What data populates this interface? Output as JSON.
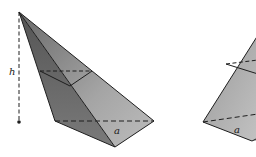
{
  "diagram": {
    "left_pyramid": {
      "height_label": "h",
      "base_edge_label": "a",
      "apex": [
        19,
        12
      ],
      "base_left": [
        55,
        121
      ],
      "base_front": [
        115,
        147
      ],
      "base_right": [
        154,
        121
      ],
      "height_foot": [
        19,
        122
      ],
      "midsection_left": [
        40,
        71
      ],
      "midsection_mid": [
        70,
        86
      ],
      "midsection_right": [
        92,
        71
      ]
    },
    "right_pyramid": {
      "base_edge_label": "a",
      "base_left": [
        203,
        122
      ],
      "base_front": [
        252,
        141
      ],
      "apex": [
        258,
        35
      ],
      "midsection_left": [
        226,
        64
      ],
      "midsection_mid": [
        243,
        71
      ],
      "midsection_right": [
        258,
        62
      ]
    },
    "colors": {
      "face_dark": "#5e5e5e",
      "face_mid": "#8c8c8c",
      "face_light": "#b4b4b4",
      "edge": "#1e1e1e"
    }
  }
}
